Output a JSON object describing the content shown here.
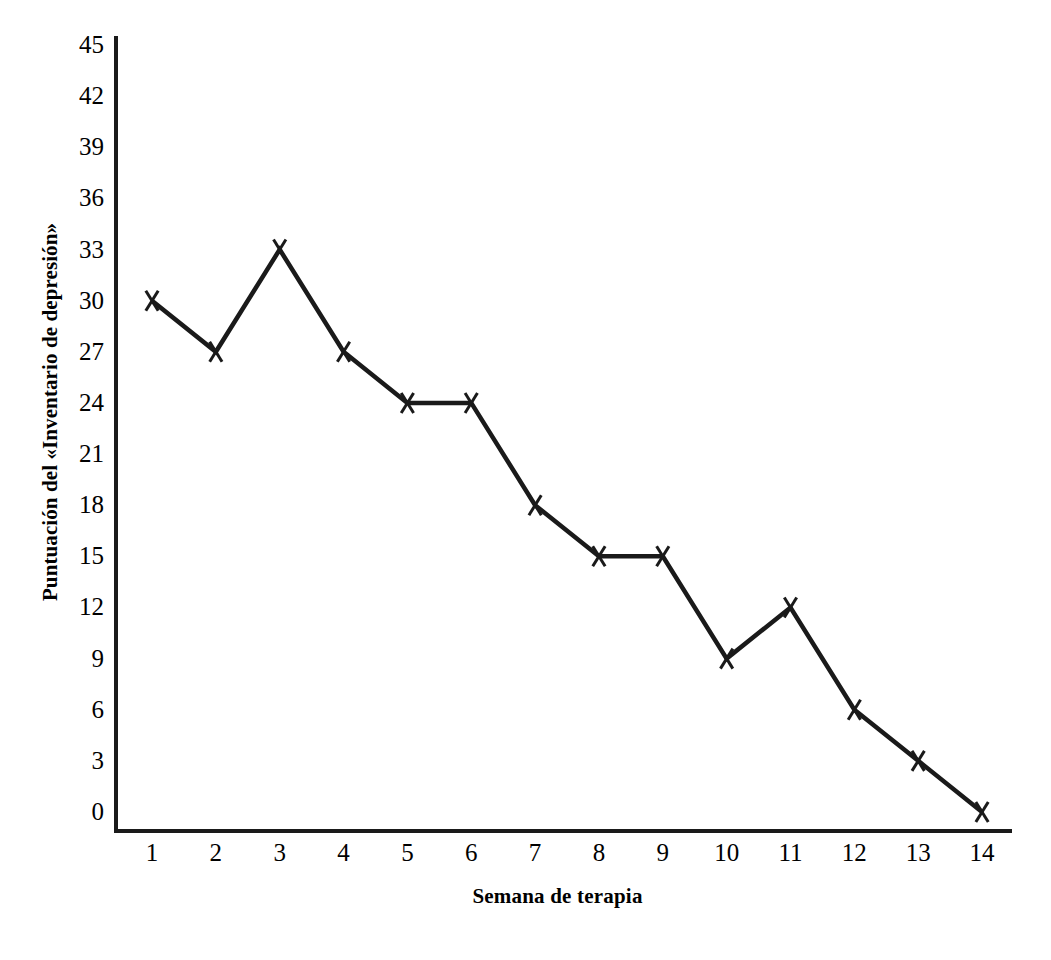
{
  "figure": {
    "background_color": "#ffffff",
    "ink_color": "#1a1a1a",
    "page_bleed_text": ""
  },
  "axes": {
    "x_title": "Semana de terapia",
    "y_title": "Puntuación del «Inventario de depresión»",
    "x_ticks": [
      "1",
      "2",
      "3",
      "4",
      "5",
      "6",
      "7",
      "8",
      "9",
      "10",
      "11",
      "12",
      "13",
      "14"
    ],
    "y_ticks": [
      "45",
      "42",
      "39",
      "36",
      "33",
      "30",
      "27",
      "24",
      "21",
      "18",
      "15",
      "12",
      "9",
      "6",
      "3",
      "0"
    ]
  },
  "chart_data": {
    "type": "line",
    "title": "",
    "xlabel": "Semana de terapia",
    "ylabel": "Puntuación del «Inventario de depresión»",
    "x": [
      1,
      2,
      3,
      4,
      5,
      6,
      7,
      8,
      9,
      10,
      11,
      12,
      13,
      14
    ],
    "categories": [
      "1",
      "2",
      "3",
      "4",
      "5",
      "6",
      "7",
      "8",
      "9",
      "10",
      "11",
      "12",
      "13",
      "14"
    ],
    "values": [
      30,
      27,
      33,
      27,
      24,
      24,
      18,
      15,
      15,
      9,
      12,
      6,
      3,
      0
    ],
    "series": [
      {
        "name": "Puntuación de depresión",
        "values": [
          30,
          27,
          33,
          27,
          24,
          24,
          18,
          15,
          15,
          9,
          12,
          6,
          3,
          0
        ],
        "marker": "x-marker",
        "color": "#1a1a1a"
      }
    ],
    "xlim": [
      0.55,
      14.45
    ],
    "ylim": [
      0,
      45
    ],
    "ytick_step": 3,
    "xtick_step": 1,
    "grid": false,
    "legend": false,
    "legend_position": "none",
    "annotations": []
  }
}
